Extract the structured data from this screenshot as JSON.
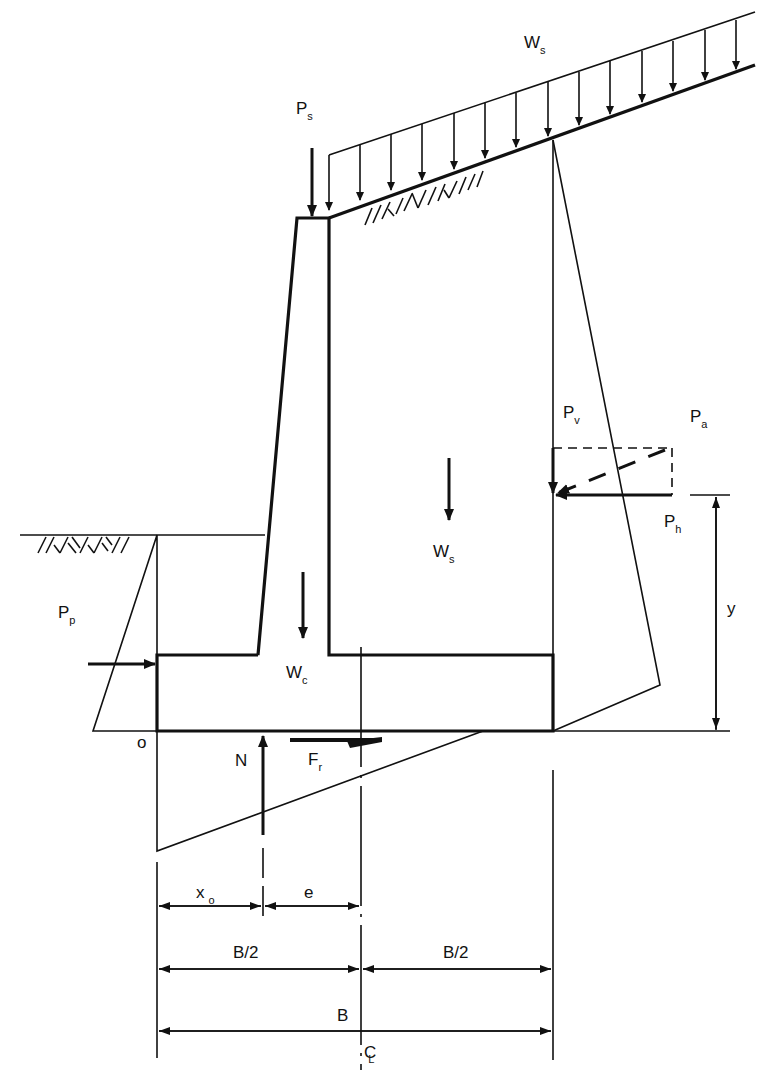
{
  "diagram": {
    "type": "retaining-wall-free-body-diagram",
    "labels": {
      "surcharge_load": {
        "main": "W",
        "sub": "s"
      },
      "point_load": {
        "main": "P",
        "sub": "s"
      },
      "active_vertical": {
        "main": "P",
        "sub": "v"
      },
      "active_resultant": {
        "main": "P",
        "sub": "a"
      },
      "active_horizontal": {
        "main": "P",
        "sub": "h"
      },
      "soil_weight": {
        "main": "W",
        "sub": "s"
      },
      "passive": {
        "main": "P",
        "sub": "p"
      },
      "concrete_weight": {
        "main": "W",
        "sub": "c"
      },
      "normal_force": "N",
      "friction_force": {
        "main": "F",
        "sub": "r"
      },
      "origin": "o",
      "lever_arm_y": "y",
      "dim_x0": {
        "main": "x",
        "sub": "o"
      },
      "dim_e": "e",
      "dim_half_left": "B/2",
      "dim_half_right": "B/2",
      "dim_full": "B",
      "centerline": {
        "main": "C",
        "sub": "L"
      }
    },
    "colors": {
      "stroke": "#111111",
      "background": "#ffffff"
    }
  }
}
